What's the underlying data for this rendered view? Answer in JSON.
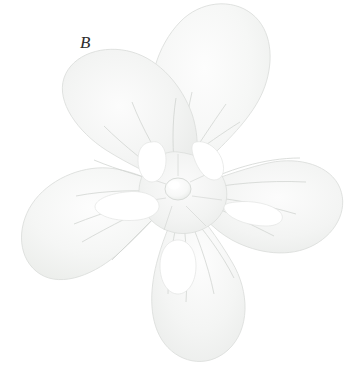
{
  "figure": {
    "panel_label": "B",
    "caption_alt": "Flower in face view with five spreading petals",
    "background_color": "#ffffff",
    "width": 346,
    "height": 377
  },
  "specimen": {
    "subject": "flower",
    "view": "face-on",
    "petal_count": 5,
    "petal_color_light": "#fbfbfb",
    "petal_color_mid": "#f2f3f2",
    "petal_color_shadow": "#e7e9e7",
    "vein_color": "#d2d5d2",
    "outline_color": "#dcdfdc",
    "center_color": "#f4f5f4",
    "center_highlight": "#fdfdfd",
    "center": {
      "x": 178,
      "y": 190
    },
    "ovary": {
      "cx": 178,
      "cy": 189,
      "rx": 13,
      "ry": 11
    },
    "petals": [
      {
        "name": "petal-top",
        "angle_deg": -86,
        "label": "upper petal"
      },
      {
        "name": "petal-upper-right",
        "angle_deg": -12,
        "label": "upper-right petal"
      },
      {
        "name": "petal-lower-right",
        "angle_deg": 62,
        "label": "lower-right petal"
      },
      {
        "name": "petal-lower-left",
        "angle_deg": 122,
        "label": "lower-left petal"
      },
      {
        "name": "petal-upper-left",
        "angle_deg": -166,
        "label": "upper-left petal"
      }
    ],
    "sinus_gaps": [
      {
        "name": "sinus-top-right"
      },
      {
        "name": "sinus-right"
      },
      {
        "name": "sinus-bottom"
      },
      {
        "name": "sinus-left"
      },
      {
        "name": "sinus-top-left"
      }
    ]
  }
}
